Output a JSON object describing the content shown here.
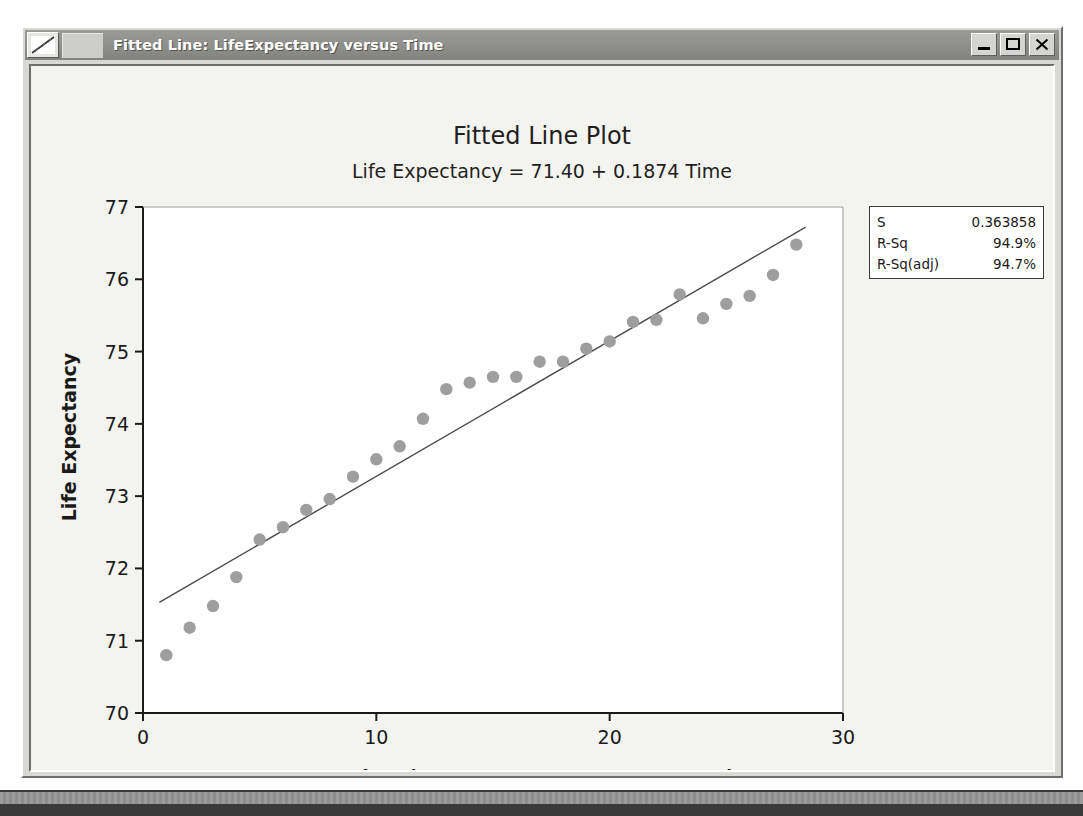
{
  "window": {
    "title": "Fitted Line: LifeExpectancy versus Time",
    "icon": "line-plot-icon",
    "buttons": {
      "minimize": "minimize-icon",
      "maximize": "maximize-icon",
      "close": "close-icon"
    }
  },
  "stats": {
    "rows": [
      {
        "label": "S",
        "value": "0.363858"
      },
      {
        "label": "R-Sq",
        "value": "94.9%"
      },
      {
        "label": "R-Sq(adj)",
        "value": "94.7%"
      }
    ]
  },
  "colors": {
    "marker": "#9e9e9e",
    "fit_line": "#4a4a4a",
    "axis": "#1a1a1a",
    "plot_bg": "#ffffff",
    "canvas_bg": "#f3f3ef",
    "titlebar": "#8e8e8a"
  },
  "chart_data": {
    "type": "scatter",
    "title": "Fitted Line Plot",
    "subtitle": "Life Expectancy =  71.40 + 0.1874 Time",
    "xlabel": "Time (1=1970, 2=1971,...,28=1997)",
    "ylabel": "Life Expectancy",
    "xlim": [
      0,
      30
    ],
    "ylim": [
      70,
      77
    ],
    "xticks": [
      0,
      10,
      20,
      30
    ],
    "yticks": [
      70,
      71,
      72,
      73,
      74,
      75,
      76,
      77
    ],
    "grid": false,
    "legend_position": "none",
    "regression": {
      "intercept": 71.4,
      "slope": 0.1874,
      "equation": "Life Expectancy =  71.40 + 0.1874 Time",
      "x_start": 0.7,
      "x_end": 28.4
    },
    "series": [
      {
        "name": "Life Expectancy",
        "marker": "filled-circle",
        "x": [
          1,
          2,
          3,
          4,
          5,
          6,
          7,
          8,
          9,
          10,
          11,
          12,
          13,
          14,
          15,
          16,
          17,
          18,
          19,
          20,
          21,
          22,
          23,
          24,
          25,
          26,
          27,
          28
        ],
        "y": [
          70.8,
          71.18,
          71.48,
          71.88,
          72.4,
          72.57,
          72.81,
          72.96,
          73.27,
          73.51,
          73.69,
          74.07,
          74.48,
          74.57,
          74.65,
          74.65,
          74.86,
          74.86,
          75.04,
          75.14,
          75.41,
          75.44,
          75.79,
          75.46,
          75.66,
          75.77,
          76.06,
          76.48
        ]
      }
    ],
    "annotations": [
      {
        "name": "stats-box",
        "lines": [
          "S                 0.363858",
          "R-Sq                 94.9%",
          "R-Sq(adj)            94.7%"
        ]
      }
    ]
  }
}
